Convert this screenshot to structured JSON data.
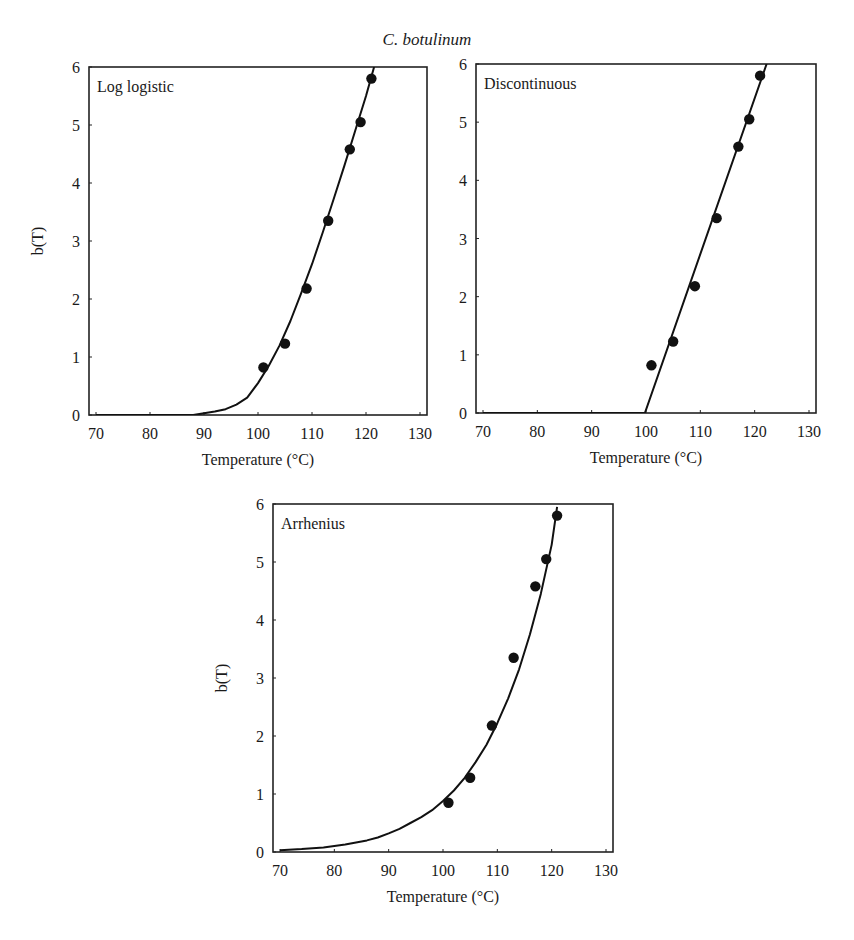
{
  "figure": {
    "title": "C. botulinum"
  },
  "chart_data": [
    {
      "type": "scatter",
      "panel_label": "Log logistic",
      "title": "C. botulinum",
      "xlabel": "Temperature (°C)",
      "ylabel": "b(T)",
      "xlim": [
        70,
        130
      ],
      "ylim": [
        0,
        6
      ],
      "xticks": [
        70,
        80,
        90,
        100,
        110,
        120,
        130
      ],
      "yticks": [
        0,
        1,
        2,
        3,
        4,
        5,
        6
      ],
      "grid": false,
      "series": [
        {
          "name": "observed",
          "kind": "points",
          "x": [
            101,
            105,
            109,
            113,
            117,
            119,
            121
          ],
          "y": [
            0.82,
            1.23,
            2.18,
            3.35,
            4.58,
            5.05,
            5.8
          ]
        },
        {
          "name": "log logistic fit",
          "kind": "line",
          "x": [
            70,
            80,
            88,
            90,
            92,
            94,
            96,
            98,
            100,
            102,
            104,
            106,
            108,
            110,
            112,
            114,
            116,
            118,
            120,
            121.5
          ],
          "y": [
            0.0,
            0.0,
            0.0,
            0.03,
            0.06,
            0.1,
            0.18,
            0.3,
            0.55,
            0.85,
            1.2,
            1.62,
            2.1,
            2.6,
            3.15,
            3.72,
            4.3,
            4.9,
            5.5,
            6.0
          ]
        }
      ]
    },
    {
      "type": "scatter",
      "panel_label": "Discontinuous",
      "xlabel": "Temperature (°C)",
      "ylabel": "",
      "xlim": [
        70,
        130
      ],
      "ylim": [
        0,
        6
      ],
      "xticks": [
        70,
        80,
        90,
        100,
        110,
        120,
        130
      ],
      "yticks": [
        0,
        1,
        2,
        3,
        4,
        5,
        6
      ],
      "grid": false,
      "series": [
        {
          "name": "observed",
          "kind": "points",
          "x": [
            101,
            105,
            109,
            113,
            117,
            119,
            121
          ],
          "y": [
            0.82,
            1.23,
            2.18,
            3.35,
            4.58,
            5.05,
            5.8
          ]
        },
        {
          "name": "discontinuous fit",
          "kind": "line",
          "x": [
            70,
            99.8,
            122.2
          ],
          "y": [
            0,
            0,
            6.0
          ]
        }
      ]
    },
    {
      "type": "scatter",
      "panel_label": "Arrhenius",
      "xlabel": "Temperature (°C)",
      "ylabel": "b(T)",
      "xlim": [
        70,
        130
      ],
      "ylim": [
        0,
        6
      ],
      "xticks": [
        70,
        80,
        90,
        100,
        110,
        120,
        130
      ],
      "yticks": [
        0,
        1,
        2,
        3,
        4,
        5,
        6
      ],
      "grid": false,
      "series": [
        {
          "name": "observed",
          "kind": "points",
          "x": [
            101,
            105,
            109,
            113,
            117,
            119,
            121
          ],
          "y": [
            0.85,
            1.28,
            2.18,
            3.35,
            4.58,
            5.05,
            5.8
          ]
        },
        {
          "name": "Arrhenius fit",
          "kind": "line",
          "x": [
            70,
            74,
            78,
            82,
            86,
            88,
            90,
            92,
            94,
            96,
            98,
            100,
            102,
            104,
            106,
            108,
            110,
            112,
            114,
            116,
            118,
            120,
            121
          ],
          "y": [
            0.03,
            0.05,
            0.08,
            0.13,
            0.2,
            0.25,
            0.32,
            0.4,
            0.5,
            0.6,
            0.72,
            0.88,
            1.06,
            1.28,
            1.55,
            1.85,
            2.22,
            2.65,
            3.15,
            3.75,
            4.45,
            5.3,
            5.95
          ]
        }
      ]
    }
  ],
  "panels": [
    {
      "label": "Log logistic",
      "xlabel": "Temperature (°C)",
      "ylabel": "b(T)"
    },
    {
      "label": "Discontinuous",
      "xlabel": "Temperature (°C)",
      "ylabel": ""
    },
    {
      "label": "Arrhenius",
      "xlabel": "Temperature (°C)",
      "ylabel": "b(T)"
    }
  ]
}
